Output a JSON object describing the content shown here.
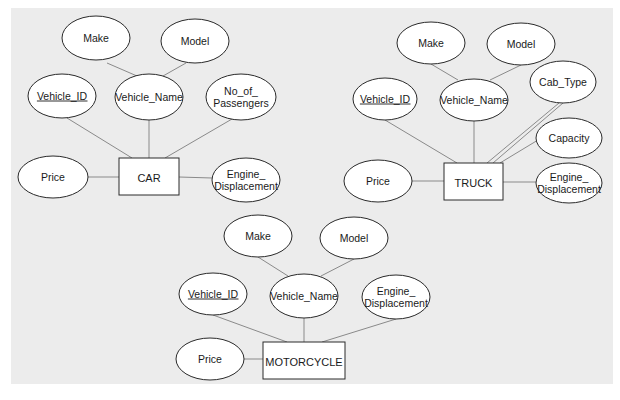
{
  "diagram": {
    "type": "er-diagram",
    "entities": [
      {
        "id": "car",
        "label": "CAR",
        "attributes": [
          {
            "id": "car-make",
            "label": "Make",
            "parent": "car-vehicle-name",
            "key": false
          },
          {
            "id": "car-model",
            "label": "Model",
            "parent": "car-vehicle-name",
            "key": false
          },
          {
            "id": "car-vehicle-id",
            "label": "Vehicle_ID",
            "parent": "car",
            "key": true
          },
          {
            "id": "car-vehicle-name",
            "label": "Vehicle_Name",
            "parent": "car",
            "key": false
          },
          {
            "id": "car-no-of-passengers",
            "label": "No_of_\nPassengers",
            "parent": "car",
            "key": false
          },
          {
            "id": "car-price",
            "label": "Price",
            "parent": "car",
            "key": false
          },
          {
            "id": "car-engine-displacement",
            "label": "Engine_\nDisplacement",
            "parent": "car",
            "key": false
          }
        ]
      },
      {
        "id": "truck",
        "label": "TRUCK",
        "attributes": [
          {
            "id": "truck-make",
            "label": "Make",
            "parent": "truck-vehicle-name",
            "key": false
          },
          {
            "id": "truck-model",
            "label": "Model",
            "parent": "truck-vehicle-name",
            "key": false
          },
          {
            "id": "truck-vehicle-id",
            "label": "Vehicle_ID",
            "parent": "truck",
            "key": true
          },
          {
            "id": "truck-vehicle-name",
            "label": "Vehicle_Name",
            "parent": "truck",
            "key": false
          },
          {
            "id": "truck-cab-type",
            "label": "Cab_Type",
            "parent": "truck",
            "key": false
          },
          {
            "id": "truck-capacity",
            "label": "Capacity",
            "parent": "truck",
            "key": false
          },
          {
            "id": "truck-price",
            "label": "Price",
            "parent": "truck",
            "key": false
          },
          {
            "id": "truck-engine-displacement",
            "label": "Engine_\nDisplacement",
            "parent": "truck",
            "key": false
          }
        ]
      },
      {
        "id": "motorcycle",
        "label": "MOTORCYCLE",
        "attributes": [
          {
            "id": "moto-make",
            "label": "Make",
            "parent": "moto-vehicle-name",
            "key": false
          },
          {
            "id": "moto-model",
            "label": "Model",
            "parent": "moto-vehicle-name",
            "key": false
          },
          {
            "id": "moto-vehicle-id",
            "label": "Vehicle_ID",
            "parent": "motorcycle",
            "key": true
          },
          {
            "id": "moto-vehicle-name",
            "label": "Vehicle_Name",
            "parent": "motorcycle",
            "key": false
          },
          {
            "id": "moto-engine-displacement",
            "label": "Engine_\nDisplacement",
            "parent": "motorcycle",
            "key": false
          },
          {
            "id": "moto-price",
            "label": "Price",
            "parent": "motorcycle",
            "key": false
          }
        ]
      }
    ]
  }
}
